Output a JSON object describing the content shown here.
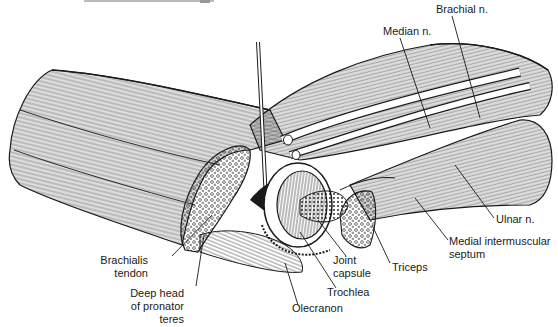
{
  "figure": {
    "type": "anatomical-illustration",
    "background": "#ffffff",
    "ink": "#1a1a1a"
  },
  "labels": [
    {
      "id": "brachial-n",
      "text": "Brachial n.",
      "x": 436,
      "y": 3,
      "align": "l"
    },
    {
      "id": "median-n",
      "text": "Median n.",
      "x": 383,
      "y": 25,
      "align": "l"
    },
    {
      "id": "ulnar-n",
      "text": "Ulnar n.",
      "x": 496,
      "y": 214,
      "align": "l"
    },
    {
      "id": "medial-intermuscular-septum",
      "line1": "Medial intermuscular",
      "line2": "septum",
      "x": 449,
      "y": 237,
      "align": "l"
    },
    {
      "id": "triceps",
      "text": "Triceps",
      "x": 392,
      "y": 262,
      "align": "l"
    },
    {
      "id": "joint-capsule",
      "line1": "Joint",
      "line2": "capsule",
      "x": 333,
      "y": 255,
      "align": "l"
    },
    {
      "id": "trochlea",
      "text": "Trochlea",
      "x": 327,
      "y": 286,
      "align": "l"
    },
    {
      "id": "olecranon",
      "text": "Olecranon",
      "x": 292,
      "y": 302,
      "align": "l"
    },
    {
      "id": "brachialis-tendon",
      "line1": "Brachialis",
      "line2": "tendon",
      "x": 146,
      "y": 254,
      "align": "r"
    },
    {
      "id": "deep-head-pronator-teres",
      "line1": "Deep head",
      "line2": "of pronator",
      "line3": "teres",
      "x": 182,
      "y": 285,
      "align": "r"
    }
  ]
}
